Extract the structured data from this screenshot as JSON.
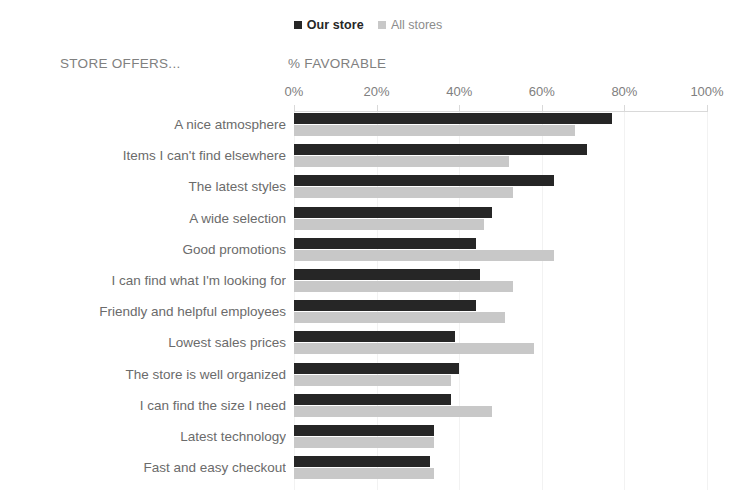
{
  "chart_data": {
    "type": "bar",
    "orientation": "horizontal",
    "title": "",
    "xlabel": "% FAVORABLE",
    "ylabel": "STORE OFFERS...",
    "xlim": [
      0,
      100
    ],
    "xticks": [
      0,
      20,
      40,
      60,
      80,
      100
    ],
    "xtick_labels": [
      "0%",
      "20%",
      "40%",
      "60%",
      "80%",
      "100%"
    ],
    "grid": true,
    "legend_position": "top-center",
    "categories": [
      "A nice atmosphere",
      "Items I can't find elsewhere",
      "The latest styles",
      "A wide selection",
      "Good promotions",
      "I can find what I'm looking for",
      "Friendly and helpful employees",
      "Lowest sales prices",
      "The store is well organized",
      "I can find the size I need",
      "Latest technology",
      "Fast and easy checkout"
    ],
    "series": [
      {
        "name": "Our store",
        "color": "#262626",
        "values": [
          77,
          71,
          63,
          48,
          44,
          45,
          44,
          39,
          40,
          38,
          34,
          33
        ]
      },
      {
        "name": "All stores",
        "color": "#c8c8c8",
        "values": [
          68,
          52,
          53,
          46,
          63,
          53,
          51,
          58,
          38,
          48,
          34,
          34
        ]
      }
    ]
  },
  "legend": {
    "items": [
      {
        "label": "Our store",
        "color": "#262626"
      },
      {
        "label": "All stores",
        "color": "#c8c8c8"
      }
    ]
  },
  "headers": {
    "category_axis_title": "STORE OFFERS...",
    "value_axis_title": "% FAVORABLE"
  },
  "colors": {
    "our_store": "#262626",
    "all_stores": "#c8c8c8",
    "axis": "#d9d9d9",
    "gridline": "#f2f2f2",
    "label_text": "#6b6b6b",
    "axis_text": "#808080",
    "background": "#ffffff"
  }
}
